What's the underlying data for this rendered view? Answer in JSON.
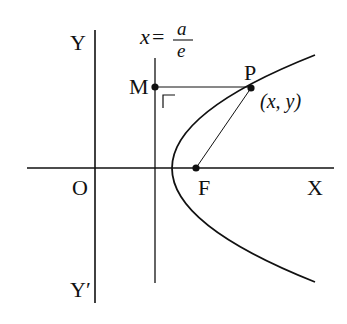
{
  "diagram": {
    "type": "parabola-focus-directrix",
    "labels": {
      "y_axis_top": "Y",
      "y_axis_bottom": "Y′",
      "x_axis": "X",
      "origin": "O",
      "focus": "F",
      "point_p": "P",
      "point_m": "M",
      "point_coords": "(x,  y)",
      "directrix_lhs": "x",
      "directrix_eq": "=",
      "directrix_num": "a",
      "directrix_den": "e"
    },
    "colors": {
      "stroke": "#111111",
      "background": "#ffffff"
    }
  }
}
